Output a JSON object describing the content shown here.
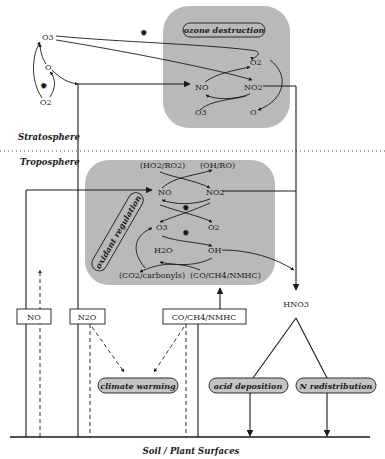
{
  "layers": {
    "stratosphere": "Stratosphere",
    "troposphere": "Troposphere",
    "surface": "Soil / Plant Surfaces"
  },
  "stratosphere_cycle": {
    "o3": "O3",
    "o": "O",
    "o2": "O2"
  },
  "ozone_destruction": {
    "title": "ozone destruction",
    "species": {
      "o2_top": "O2",
      "no": "NO",
      "no2": "NO2",
      "o3_bottom": "O3",
      "o_bottom": "O"
    }
  },
  "oxidant_regulation": {
    "title": "oxidant regulation",
    "species": {
      "ho2_ro2": "(HO2/RO2)",
      "oh_ro": "(OH/RO)",
      "no": "NO",
      "no2": "NO2",
      "o3": "O3",
      "o2": "O2",
      "h2o": "H2O",
      "oh": "OH",
      "co2_carbonyls": "(CO2/carbonyls)",
      "co_ch4_nmhc": "(CO/CH4/NMHC)"
    }
  },
  "emission_boxes": {
    "no": "NO",
    "n2o": "N2O",
    "co_ch4_nmhc": "CO/CH4/NMHC"
  },
  "hno3": "HNO3",
  "impacts": {
    "climate_warming": "climate warming",
    "acid_deposition": "acid deposition",
    "n_redistribution": "N redistribution"
  },
  "colors": {
    "panel_fill": "#b9b9b9",
    "pill_fill": "#c4c4c4",
    "line": "#1a1a1a"
  }
}
